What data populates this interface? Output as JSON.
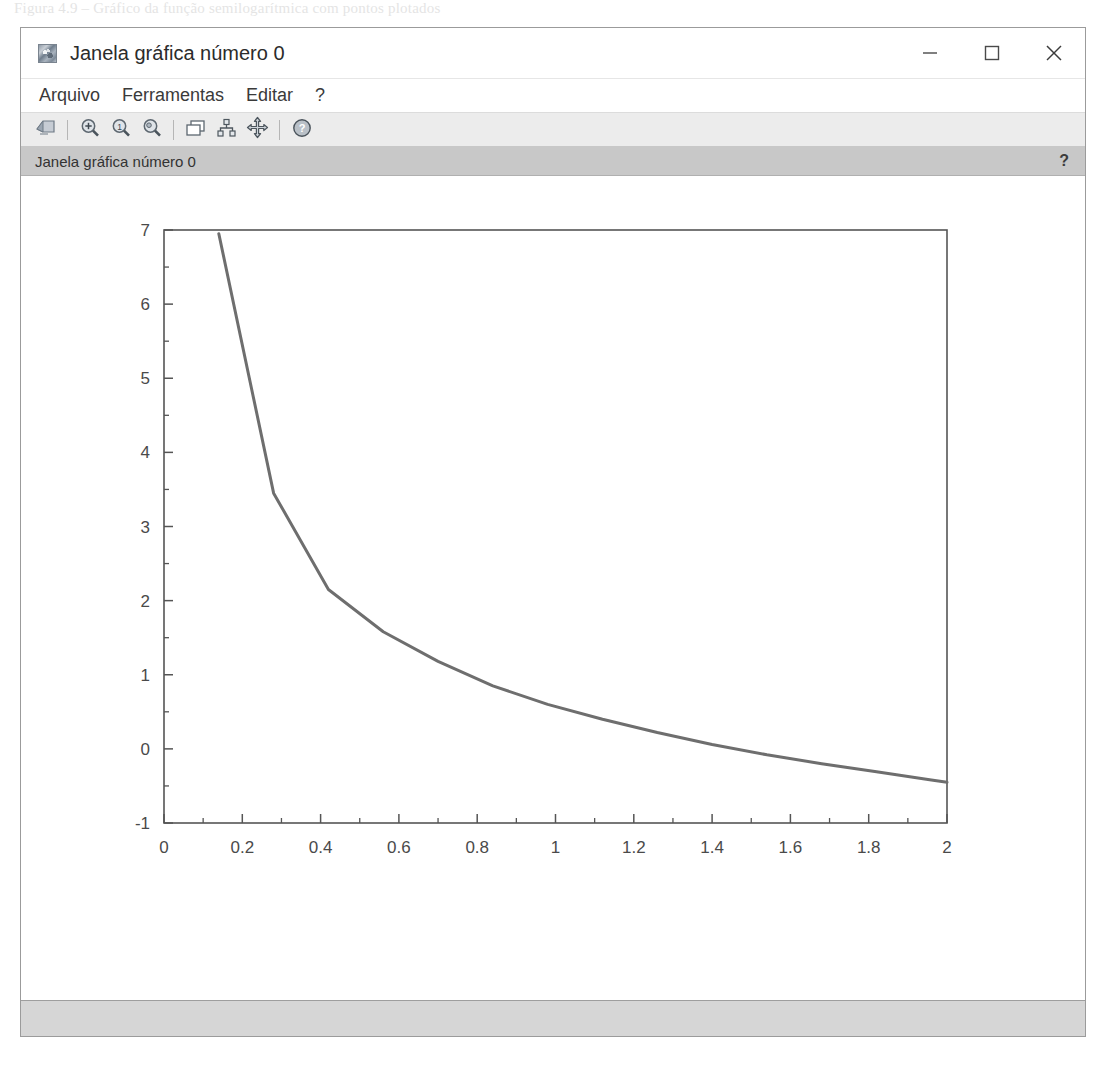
{
  "page_caption": "Figura 4.9 – Gráfico da função semilogarítmica com pontos plotados",
  "window": {
    "title": "Janela gráfica número 0",
    "icon": "scilab-graphic-icon",
    "controls": {
      "minimize": "minimize-icon",
      "maximize": "maximize-icon",
      "close": "close-icon"
    }
  },
  "menu": {
    "items": [
      {
        "label": "Arquivo",
        "name": "menu-arquivo"
      },
      {
        "label": "Ferramentas",
        "name": "menu-ferramentas"
      },
      {
        "label": "Editar",
        "name": "menu-editar"
      },
      {
        "label": "?",
        "name": "menu-help"
      }
    ]
  },
  "toolbar": {
    "buttons": [
      {
        "name": "export-image-button",
        "icon": "export-graphic-icon",
        "tooltip": "Exportar"
      },
      {
        "name": "zoom-in-button",
        "icon": "magnifier-plus-icon",
        "tooltip": "Zoom +"
      },
      {
        "name": "zoom-original-button",
        "icon": "magnifier-one-icon",
        "tooltip": "Zoom original"
      },
      {
        "name": "zoom-out-button",
        "icon": "magnifier-minus-icon",
        "tooltip": "Zoom -"
      },
      {
        "name": "windows-button",
        "icon": "cascade-windows-icon",
        "tooltip": "Janelas"
      },
      {
        "name": "graph-tree-button",
        "icon": "graph-hierarchy-icon",
        "tooltip": "Editor de gráfico"
      },
      {
        "name": "pan-button",
        "icon": "move-arrows-icon",
        "tooltip": "Mover"
      },
      {
        "name": "help-button",
        "icon": "question-mark-circle-icon",
        "tooltip": "Ajuda"
      }
    ]
  },
  "tab_strip": {
    "label": "Janela gráfica número 0",
    "help_glyph": "?"
  },
  "status_bar": {
    "text": ""
  },
  "chart_data": {
    "type": "line",
    "title": "",
    "xlabel": "",
    "ylabel": "",
    "xlim": [
      0,
      2
    ],
    "ylim": [
      -1,
      7
    ],
    "xticks": [
      0,
      0.2,
      0.4,
      0.6,
      0.8,
      1,
      1.2,
      1.4,
      1.6,
      1.8,
      2
    ],
    "xtick_labels": [
      "0",
      "0.2",
      "0.4",
      "0.6",
      "0.8",
      "1",
      "1.2",
      "1.4",
      "1.6",
      "1.8",
      "2"
    ],
    "yticks": [
      -1,
      0,
      1,
      2,
      3,
      4,
      5,
      6,
      7
    ],
    "ytick_labels": [
      "-1",
      "0",
      "1",
      "2",
      "3",
      "4",
      "5",
      "6",
      "7"
    ],
    "minor_ticks": true,
    "grid": false,
    "legend": null,
    "line_color": "#6e6e6e",
    "line_width": 3,
    "series": [
      {
        "name": "curva",
        "x": [
          0.14,
          0.28,
          0.42,
          0.56,
          0.7,
          0.84,
          0.98,
          1.12,
          1.26,
          1.4,
          1.54,
          1.68,
          1.82,
          1.96,
          2.0
        ],
        "y": [
          6.95,
          3.45,
          2.15,
          1.58,
          1.18,
          0.85,
          0.6,
          0.4,
          0.22,
          0.06,
          -0.08,
          -0.2,
          -0.31,
          -0.42,
          -0.45
        ]
      }
    ]
  }
}
